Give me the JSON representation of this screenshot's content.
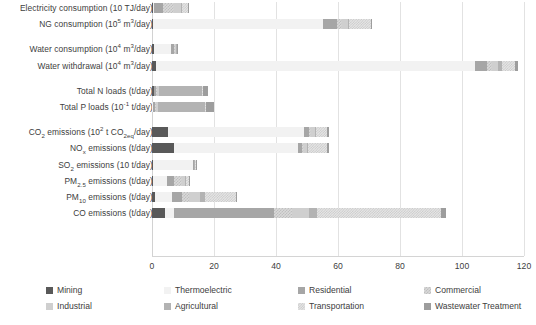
{
  "chart_data": {
    "type": "bar",
    "orientation": "horizontal",
    "stacked": true,
    "title": "",
    "xlabel": "",
    "ylabel": "",
    "xlim": [
      0,
      120
    ],
    "xticks": [
      0,
      20,
      40,
      60,
      80,
      100,
      120
    ],
    "xtick_labels": [
      "0",
      "20",
      "40",
      "60",
      "80",
      "100",
      "120"
    ],
    "grid": true,
    "legend_position": "bottom",
    "series": [
      {
        "name": "Mining",
        "color": "#595959",
        "pattern": "solid"
      },
      {
        "name": "Thermoelectric",
        "color": "#f2f2f2",
        "pattern": "solid"
      },
      {
        "name": "Residential",
        "color": "#a6a6a6",
        "pattern": "solid"
      },
      {
        "name": "Commercial",
        "color": "#d9d9d9",
        "pattern": "checker"
      },
      {
        "name": "Industrial",
        "color": "#cfcfcf",
        "pattern": "solid"
      },
      {
        "name": "Agricultural",
        "color": "#b3b3b3",
        "pattern": "solid"
      },
      {
        "name": "Transportation",
        "color": "#e6e6e6",
        "pattern": "checker"
      },
      {
        "name": "Wastewater Treatment",
        "color": "#9d9d9d",
        "pattern": "solid"
      }
    ],
    "categories": [
      "Electricity consumption (10 TJ/day)",
      "NG consumption (10⁵ m³/day)",
      "Water consumption (10⁴ m³/day)",
      "Water withdrawal (10⁴ m³/day)",
      "Total N loads (t/day)",
      "Total P loads (10⁻¹ t/day)",
      "CO₂ emissions (10² t CO₂eq/day)",
      "NOₓ emissions (t/day)",
      "SO₂ emissions (10 t/day)",
      "PM₂.₅ emissions (t/day)",
      "PM₁₀ emissions (t/day)",
      "CO emissions (t/day)"
    ],
    "rows": [
      {
        "category": "Electricity consumption (10 TJ/day)",
        "label_html": "Electricity consumption (10 TJ/day)",
        "group": "energy",
        "total": 12.0,
        "segments": [
          {
            "series": "Mining",
            "value": 0.4
          },
          {
            "series": "Thermoelectric",
            "value": 0.2
          },
          {
            "series": "Residential",
            "value": 3.0
          },
          {
            "series": "Commercial",
            "value": 3.4
          },
          {
            "series": "Industrial",
            "value": 2.4
          },
          {
            "series": "Agricultural",
            "value": 0.4
          },
          {
            "series": "Transportation",
            "value": 1.8
          },
          {
            "series": "Wastewater Treatment",
            "value": 0.4
          }
        ]
      },
      {
        "category": "NG consumption (10⁵ m³/day)",
        "label_html": "NG consumption (10<sup>5</sup> m<sup>3</sup>/day)",
        "group": "energy",
        "total": 71.0,
        "segments": [
          {
            "series": "Mining",
            "value": 0.3
          },
          {
            "series": "Thermoelectric",
            "value": 55.0
          },
          {
            "series": "Residential",
            "value": 4.5
          },
          {
            "series": "Commercial",
            "value": 1.5
          },
          {
            "series": "Industrial",
            "value": 2.0
          },
          {
            "series": "Agricultural",
            "value": 0.4
          },
          {
            "series": "Transportation",
            "value": 6.8
          },
          {
            "series": "Wastewater Treatment",
            "value": 0.5
          }
        ]
      },
      {
        "category": "Water consumption (10⁴ m³/day)",
        "label_html": "Water consumption (10<sup>4</sup> m<sup>3</sup>/day)",
        "group": "water",
        "total": 8.2,
        "segments": [
          {
            "series": "Mining",
            "value": 0.5
          },
          {
            "series": "Thermoelectric",
            "value": 5.7
          },
          {
            "series": "Residential",
            "value": 0.8
          },
          {
            "series": "Commercial",
            "value": 0.3
          },
          {
            "series": "Industrial",
            "value": 0.4
          },
          {
            "series": "Agricultural",
            "value": 0.3
          },
          {
            "series": "Transportation",
            "value": 0.0
          },
          {
            "series": "Wastewater Treatment",
            "value": 0.2
          }
        ]
      },
      {
        "category": "Water withdrawal (10⁴ m³/day)",
        "label_html": "Water withdrawal (10<sup>4</sup> m<sup>3</sup>/day)",
        "group": "water",
        "total": 118.0,
        "segments": [
          {
            "series": "Mining",
            "value": 1.2
          },
          {
            "series": "Thermoelectric",
            "value": 103.0
          },
          {
            "series": "Residential",
            "value": 4.0
          },
          {
            "series": "Commercial",
            "value": 1.5
          },
          {
            "series": "Industrial",
            "value": 2.0
          },
          {
            "series": "Agricultural",
            "value": 1.3
          },
          {
            "series": "Transportation",
            "value": 4.2
          },
          {
            "series": "Wastewater Treatment",
            "value": 0.8
          }
        ]
      },
      {
        "category": "Total N loads (t/day)",
        "label_html": "Total N loads (t/day)",
        "group": "nutrients",
        "total": 18.0,
        "segments": [
          {
            "series": "Mining",
            "value": 0.5
          },
          {
            "series": "Thermoelectric",
            "value": 0.2
          },
          {
            "series": "Residential",
            "value": 0.6
          },
          {
            "series": "Commercial",
            "value": 0.4
          },
          {
            "series": "Industrial",
            "value": 0.7
          },
          {
            "series": "Agricultural",
            "value": 13.6
          },
          {
            "series": "Transportation",
            "value": 0.4
          },
          {
            "series": "Wastewater Treatment",
            "value": 1.6
          }
        ]
      },
      {
        "category": "Total P loads (10⁻¹ t/day)",
        "label_html": "Total P loads (10<sup>-1</sup> t/day)",
        "group": "nutrients",
        "total": 20.0,
        "segments": [
          {
            "series": "Mining",
            "value": 0.1
          },
          {
            "series": "Thermoelectric",
            "value": 0.2
          },
          {
            "series": "Residential",
            "value": 0.6
          },
          {
            "series": "Commercial",
            "value": 0.4
          },
          {
            "series": "Industrial",
            "value": 0.5
          },
          {
            "series": "Agricultural",
            "value": 15.2
          },
          {
            "series": "Transportation",
            "value": 0.4
          },
          {
            "series": "Wastewater Treatment",
            "value": 2.6
          }
        ]
      },
      {
        "category": "CO₂ emissions (10² t CO₂eq/day)",
        "label_html": "CO<sub>2</sub> emissions (10<sup>2</sup> t CO<sub>2eq</sub>/day)",
        "group": "air",
        "total": 57.0,
        "segments": [
          {
            "series": "Mining",
            "value": 5.0
          },
          {
            "series": "Thermoelectric",
            "value": 44.0
          },
          {
            "series": "Residential",
            "value": 1.5
          },
          {
            "series": "Commercial",
            "value": 0.8
          },
          {
            "series": "Industrial",
            "value": 1.2
          },
          {
            "series": "Agricultural",
            "value": 0.4
          },
          {
            "series": "Transportation",
            "value": 3.6
          },
          {
            "series": "Wastewater Treatment",
            "value": 0.5
          }
        ]
      },
      {
        "category": "NOₓ emissions (t/day)",
        "label_html": "NO<sub>x</sub> emissions (t/day)",
        "group": "air",
        "total": 57.0,
        "segments": [
          {
            "series": "Mining",
            "value": 7.2
          },
          {
            "series": "Thermoelectric",
            "value": 40.0
          },
          {
            "series": "Residential",
            "value": 1.2
          },
          {
            "series": "Commercial",
            "value": 0.6
          },
          {
            "series": "Industrial",
            "value": 1.0
          },
          {
            "series": "Agricultural",
            "value": 0.4
          },
          {
            "series": "Transportation",
            "value": 6.2
          },
          {
            "series": "Wastewater Treatment",
            "value": 0.4
          }
        ]
      },
      {
        "category": "SO₂ emissions (10 t/day)",
        "label_html": "SO<sub>2</sub> emissions (10 t/day)",
        "group": "air",
        "total": 14.2,
        "segments": [
          {
            "series": "Mining",
            "value": 0.2
          },
          {
            "series": "Thermoelectric",
            "value": 13.0
          },
          {
            "series": "Residential",
            "value": 0.2
          },
          {
            "series": "Commercial",
            "value": 0.1
          },
          {
            "series": "Industrial",
            "value": 0.2
          },
          {
            "series": "Agricultural",
            "value": 0.1
          },
          {
            "series": "Transportation",
            "value": 0.3
          },
          {
            "series": "Wastewater Treatment",
            "value": 0.1
          }
        ]
      },
      {
        "category": "PM₂.₅ emissions (t/day)",
        "label_html": "PM<sub>2.5</sub> emissions (t/day)",
        "group": "air",
        "total": 12.0,
        "segments": [
          {
            "series": "Mining",
            "value": 0.3
          },
          {
            "series": "Thermoelectric",
            "value": 4.5
          },
          {
            "series": "Residential",
            "value": 2.4
          },
          {
            "series": "Commercial",
            "value": 2.6
          },
          {
            "series": "Industrial",
            "value": 0.8
          },
          {
            "series": "Agricultural",
            "value": 0.5
          },
          {
            "series": "Transportation",
            "value": 0.7
          },
          {
            "series": "Wastewater Treatment",
            "value": 0.2
          }
        ]
      },
      {
        "category": "PM₁₀ emissions (t/day)",
        "label_html": "PM<sub>10</sub> emissions (t/day)",
        "group": "air",
        "total": 27.5,
        "segments": [
          {
            "series": "Mining",
            "value": 0.9
          },
          {
            "series": "Thermoelectric",
            "value": 5.5
          },
          {
            "series": "Residential",
            "value": 3.2
          },
          {
            "series": "Commercial",
            "value": 2.4
          },
          {
            "series": "Industrial",
            "value": 3.6
          },
          {
            "series": "Agricultural",
            "value": 1.4
          },
          {
            "series": "Transportation",
            "value": 10.0
          },
          {
            "series": "Wastewater Treatment",
            "value": 0.5
          }
        ]
      },
      {
        "category": "CO emissions (t/day)",
        "label_html": "CO emissions (t/day)",
        "group": "air",
        "total": 95.0,
        "segments": [
          {
            "series": "Mining",
            "value": 4.2
          },
          {
            "series": "Thermoelectric",
            "value": 3.0
          },
          {
            "series": "Residential",
            "value": 32.0
          },
          {
            "series": "Commercial",
            "value": 6.0
          },
          {
            "series": "Industrial",
            "value": 5.5
          },
          {
            "series": "Agricultural",
            "value": 2.5
          },
          {
            "series": "Transportation",
            "value": 40.0
          },
          {
            "series": "Wastewater Treatment",
            "value": 1.8
          }
        ]
      }
    ],
    "row_order": [
      "Electricity consumption (10 TJ/day)",
      "NG consumption (10⁵ m³/day)",
      "Water consumption (10⁴ m³/day)",
      "Water withdrawal (10⁴ m³/day)",
      "Total N loads (t/day)",
      "Total P loads (10⁻¹ t/day)",
      "CO₂ emissions (10² t CO₂eq/day)",
      "NOₓ emissions (t/day)",
      "SO₂ emissions (10 t/day)",
      "PM₂.₅ emissions (t/day)",
      "PM₁₀ emissions (t/day)",
      "CO emissions (t/day)"
    ],
    "group_breaks_after": [
      1,
      3,
      5
    ]
  },
  "legend": {
    "items": [
      {
        "label": "Mining",
        "color": "#595959"
      },
      {
        "label": "Thermoelectric",
        "color": "#f2f2f2"
      },
      {
        "label": "Residential",
        "color": "#a6a6a6"
      },
      {
        "label": "Commercial",
        "color": "#d9d9d9"
      },
      {
        "label": "Industrial",
        "color": "#cfcfcf"
      },
      {
        "label": "Agricultural",
        "color": "#b3b3b3"
      },
      {
        "label": "Transportation",
        "color": "#e6e6e6"
      },
      {
        "label": "Wastewater Treatment",
        "color": "#9d9d9d"
      }
    ]
  }
}
